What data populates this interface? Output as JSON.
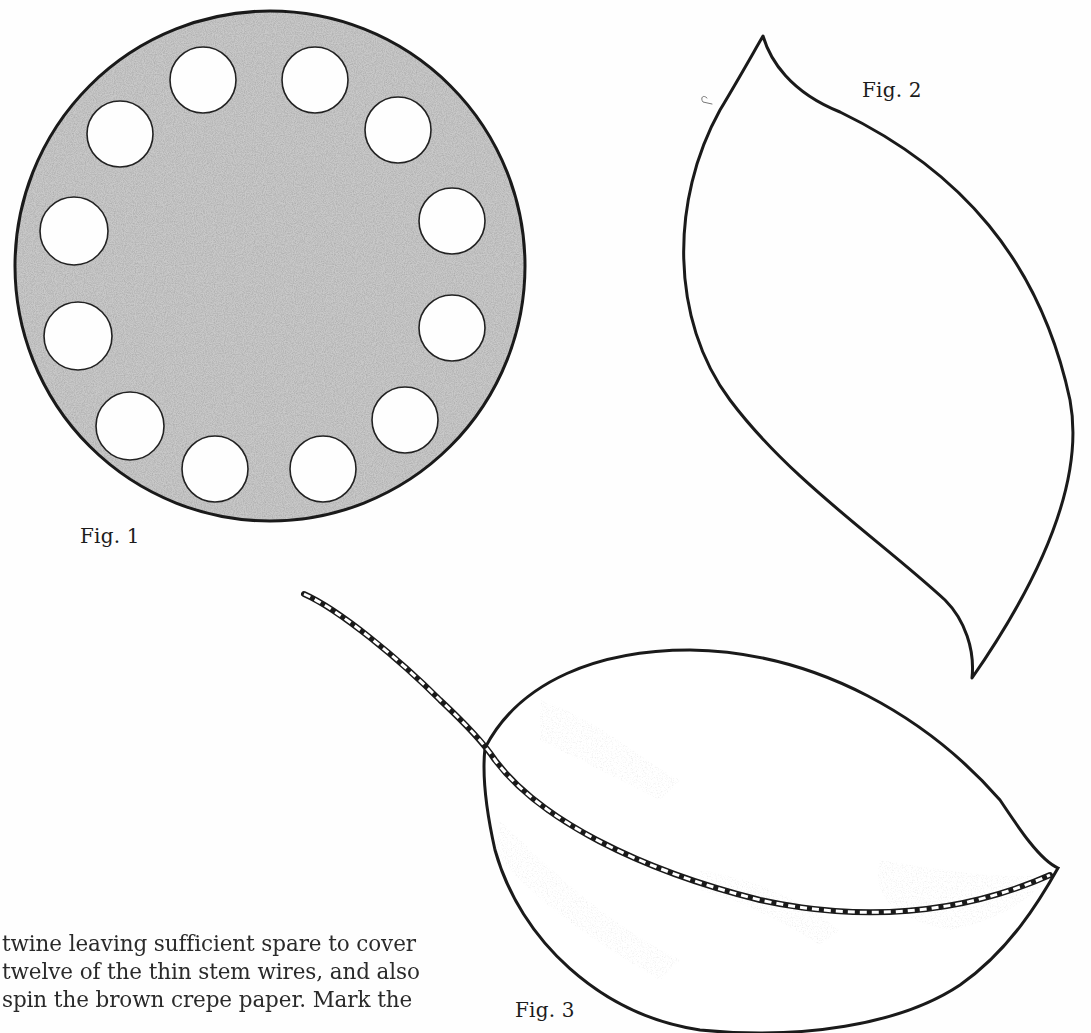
{
  "figures": [
    {
      "label": "Fig. 1",
      "subject": "perforated disc with twelve holes"
    },
    {
      "label": "Fig. 2",
      "subject": "leaf template outline"
    },
    {
      "label": "Fig. 3",
      "subject": "shaded leaf with wire-wrapped stem"
    }
  ],
  "text": {
    "lines": [
      "twine leaving sufficient spare to cover",
      "twelve of the thin stem wires, and also",
      "spin the brown crepe paper. Mark the"
    ]
  },
  "colors": {
    "ink": "#1a1a1a",
    "shading": "#8a8a8a",
    "paper": "#fefefe"
  },
  "disc": {
    "hole_count": 12
  }
}
